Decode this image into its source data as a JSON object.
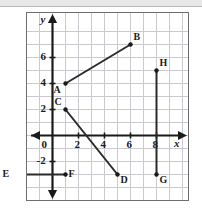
{
  "figure": {
    "type": "coordinate-plane",
    "axis_labels": {
      "x": "x",
      "y": "y"
    },
    "x_ticks": [
      {
        "value": 0,
        "label": "0"
      },
      {
        "value": 2,
        "label": "2"
      },
      {
        "value": 4,
        "label": "4"
      },
      {
        "value": 6,
        "label": "6"
      },
      {
        "value": 8,
        "label": "8"
      }
    ],
    "y_ticks": [
      {
        "value": 2,
        "label": "2"
      },
      {
        "value": 4,
        "label": "4"
      },
      {
        "value": 6,
        "label": "6"
      },
      {
        "value": -2,
        "label": "-2"
      }
    ]
  },
  "chart_data": {
    "type": "scatter",
    "title": "",
    "xlabel": "x",
    "ylabel": "y",
    "xlim": [
      -4,
      10
    ],
    "ylim": [
      -5,
      8
    ],
    "grid": true,
    "legend": "none",
    "points": [
      {
        "name": "A",
        "x": 1,
        "y": 4,
        "label": "A",
        "label_pos": "below-left"
      },
      {
        "name": "B",
        "x": 6,
        "y": 7,
        "label": "B",
        "label_pos": "above-right"
      },
      {
        "name": "C",
        "x": 1,
        "y": 2,
        "label": "C",
        "label_pos": "above-left"
      },
      {
        "name": "D",
        "x": 5,
        "y": -3,
        "label": "D",
        "label_pos": "below-right"
      },
      {
        "name": "E",
        "x": -3,
        "y": -3,
        "label": "E",
        "label_pos": "left"
      },
      {
        "name": "F",
        "x": 1,
        "y": -3,
        "label": "F",
        "label_pos": "right"
      },
      {
        "name": "G",
        "x": 8,
        "y": -3,
        "label": "G",
        "label_pos": "below-right"
      },
      {
        "name": "H",
        "x": 8,
        "y": 5,
        "label": "H",
        "label_pos": "above-right"
      }
    ],
    "segments": [
      {
        "name": "AB",
        "from": "A",
        "to": "B",
        "x1": 1,
        "y1": 4,
        "x2": 6,
        "y2": 7
      },
      {
        "name": "CD",
        "from": "C",
        "to": "D",
        "x1": 1,
        "y1": 2,
        "x2": 5,
        "y2": -3
      },
      {
        "name": "EF",
        "from": "E",
        "to": "F",
        "x1": -3,
        "y1": -3,
        "x2": 1,
        "y2": -3
      },
      {
        "name": "GH",
        "from": "G",
        "to": "H",
        "x1": 8,
        "y1": -3,
        "x2": 8,
        "y2": 5
      }
    ]
  },
  "style": {
    "grid_color": "#c9c9cf",
    "axis_color": "#1a1a1a",
    "segment_color": "#2b2b2b",
    "point_color": "#1a1a1a",
    "frame_color": "#6e6e6e",
    "background": "#ffffff"
  }
}
